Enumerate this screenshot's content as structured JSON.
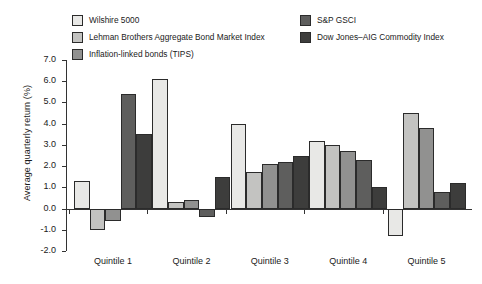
{
  "chart_data": {
    "type": "bar",
    "title": "",
    "xlabel": "",
    "ylabel": "Average quarterly return (%)",
    "ylim": [
      -2.0,
      7.0
    ],
    "ytick_labels": [
      "7.0",
      "6.0",
      "5.0",
      "4.0",
      "3.0",
      "2.0",
      "1.0",
      "0.0",
      "-1.0",
      "-2.0"
    ],
    "ytick_values": [
      7.0,
      6.0,
      5.0,
      4.0,
      3.0,
      2.0,
      1.0,
      0.0,
      -1.0,
      -2.0
    ],
    "grid": false,
    "legend_position": "top",
    "categories": [
      "Quintile 1",
      "Quintile 2",
      "Quintile 3",
      "Quintile 4",
      "Quintile 5"
    ],
    "series": [
      {
        "name": "Wilshire 5000",
        "color": "#e8e8e6",
        "values": [
          1.3,
          6.1,
          4.0,
          3.2,
          -1.3
        ]
      },
      {
        "name": "Lehman Brothers Aggregate Bond Market Index",
        "color": "#c3c3c1",
        "values": [
          -1.0,
          0.3,
          1.7,
          3.0,
          4.5
        ]
      },
      {
        "name": "Inflation-linked bonds (TIPS)",
        "color": "#919190",
        "values": [
          -0.6,
          0.4,
          2.1,
          2.7,
          3.8
        ]
      },
      {
        "name": "S&P GSCI",
        "color": "#5e5e5d",
        "values": [
          5.4,
          -0.4,
          2.2,
          2.3,
          0.8
        ]
      },
      {
        "name": "Dow Jones–AIG Commodity Index",
        "color": "#3d3d3c",
        "values": [
          3.5,
          1.5,
          2.5,
          1.0,
          1.2
        ]
      }
    ]
  },
  "legend": {
    "columns": [
      {
        "entries": [
          {
            "label": "Wilshire 5000",
            "color": "#e8e8e6"
          },
          {
            "label": "Lehman Brothers Aggregate Bond Market Index",
            "color": "#c3c3c1"
          },
          {
            "label": "Inflation-linked bonds (TIPS)",
            "color": "#919190"
          }
        ]
      },
      {
        "entries": [
          {
            "label": "S&P GSCI",
            "color": "#5e5e5d"
          },
          {
            "label": "Dow Jones–AIG Commodity Index",
            "color": "#3d3d3c"
          }
        ]
      }
    ]
  }
}
